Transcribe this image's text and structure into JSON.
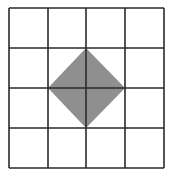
{
  "diagram": {
    "type": "grid-with-shaded-square",
    "grid": {
      "rows": 4,
      "cols": 4,
      "x_lines": [
        9,
        48,
        86,
        125,
        164
      ],
      "y_lines": [
        8,
        48,
        88,
        128,
        168
      ],
      "line_color": "#2a2a2a",
      "line_width": 1.6
    },
    "shape": {
      "kind": "diamond",
      "description": "square rotated 45 degrees centered on middle grid vertex, vertices at midpoints of the 2x2 central block edges",
      "points": [
        [
          86,
          48
        ],
        [
          125,
          88
        ],
        [
          86,
          128
        ],
        [
          48,
          88
        ]
      ],
      "fill": "#8f8f8f"
    },
    "background": "#ffffff"
  }
}
